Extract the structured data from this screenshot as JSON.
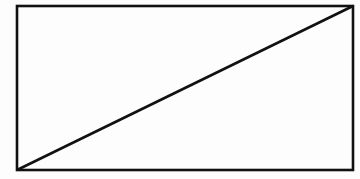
{
  "diagram": {
    "canvas": {
      "width": 360,
      "height": 179,
      "background": "#fdfdfd"
    },
    "stroke_color": "#111111",
    "stroke_width": 2.6,
    "rectangle": {
      "x": 17,
      "y": 6,
      "width": 336,
      "height": 164
    },
    "diagonal": {
      "x1": 17,
      "y1": 170,
      "x2": 353,
      "y2": 6
    }
  }
}
